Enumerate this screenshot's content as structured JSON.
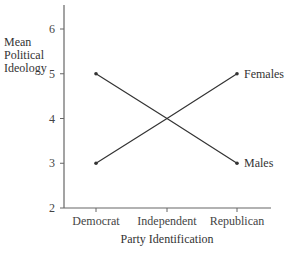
{
  "chart_data": {
    "type": "line",
    "title": "",
    "xlabel": "Party Identification",
    "ylabel": [
      "Mean",
      "Political",
      "Ideology"
    ],
    "categories": [
      "Democrat",
      "Independent",
      "Republican"
    ],
    "yticks": [
      2,
      3,
      4,
      5,
      6
    ],
    "ylim": [
      2,
      6.5
    ],
    "grid": false,
    "legend": "inline-right",
    "series": [
      {
        "name": "Females",
        "values": [
          3,
          4,
          5
        ]
      },
      {
        "name": "Males",
        "values": [
          5,
          4,
          3
        ]
      }
    ],
    "colors": {
      "line": "#333333",
      "axis": "#666666",
      "text": "#333333"
    }
  }
}
